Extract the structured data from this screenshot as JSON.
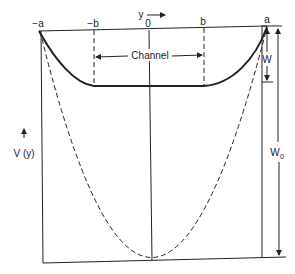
{
  "diagram": {
    "colors": {
      "line": "#222222",
      "background": "#ffffff"
    },
    "labels": {
      "neg_a": "−a",
      "neg_b": "−b",
      "zero": "0",
      "b": "b",
      "a": "a",
      "y_axis": "y",
      "channel": "Channel",
      "w": "W",
      "w0": "W",
      "w0_sub": "0",
      "v_of_y": "V (y)"
    },
    "curves": {
      "solid_profile": "thick solid curve: descends from −a to flat bottom between −b and b, rises to a",
      "dashed_parabola": "dashed parabola from −a through bottom vertex at y=0 to a"
    },
    "dimensions": {
      "W": "depth of solid profile below top line",
      "W0": "depth of dashed parabola vertex below top line"
    }
  }
}
